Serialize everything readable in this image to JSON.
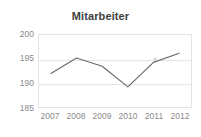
{
  "chart_data": {
    "type": "line",
    "title": "Mitarbeiter",
    "xlabel": "",
    "ylabel": "",
    "categories": [
      "2007",
      "2008",
      "2009",
      "2010",
      "2011",
      "2012"
    ],
    "values": [
      192.0,
      195.2,
      193.5,
      189.2,
      194.3,
      196.2
    ],
    "series": [
      {
        "name": "Mitarbeiter",
        "values": [
          192.0,
          195.2,
          193.5,
          189.2,
          194.3,
          196.2
        ]
      }
    ],
    "ylim": [
      185,
      200
    ],
    "yticks": [
      200,
      195,
      190,
      185
    ],
    "ytick_labels": [
      "200",
      "195",
      "190",
      "185"
    ],
    "xtick_labels": [
      "2007",
      "2008",
      "2009",
      "2010",
      "2011",
      "2012"
    ],
    "grid": true,
    "legend": false,
    "legend_position": "none",
    "line_color": "#6b6b6b",
    "grid_color": "#e6e6e6",
    "axis_color": "#e2e2e2",
    "text_color": "#8a8a8a",
    "title_color": "#3d3d3d",
    "background": "#ffffff"
  }
}
